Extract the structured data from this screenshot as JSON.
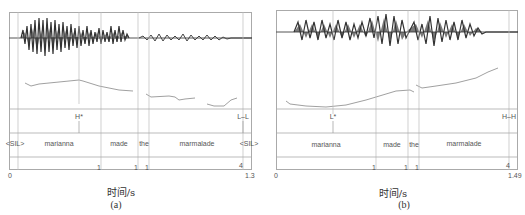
{
  "figure": {
    "panels": [
      {
        "id": "a",
        "caption": "(a)",
        "x_axis_label": "时间/s",
        "x_start": "0",
        "x_end": "1.3",
        "tone_tier": [
          {
            "label": "H*",
            "pos": 0.29
          },
          {
            "label": "L–L",
            "pos": 0.965
          }
        ],
        "word_tier": [
          {
            "label": "<SIL>",
            "start": 0.0,
            "end": 0.04
          },
          {
            "label": "marianna",
            "start": 0.04,
            "end": 0.38
          },
          {
            "label": "made",
            "start": 0.38,
            "end": 0.53
          },
          {
            "label": "the",
            "start": 0.53,
            "end": 0.575
          },
          {
            "label": "marmalade",
            "start": 0.575,
            "end": 0.965
          },
          {
            "label": "<SIL>",
            "start": 0.965,
            "end": 1.0
          }
        ],
        "break_tier": [
          {
            "label": "1",
            "pos": 0.38
          },
          {
            "label": "1",
            "pos": 0.53
          },
          {
            "label": "1",
            "pos": 0.575
          },
          {
            "label": "4",
            "pos": 0.965
          }
        ]
      },
      {
        "id": "b",
        "caption": "(b)",
        "x_axis_label": "时间/s",
        "x_start": "0",
        "x_end": "1.49",
        "tone_tier": [
          {
            "label": "L*",
            "pos": 0.235
          },
          {
            "label": "H–H",
            "pos": 0.965
          }
        ],
        "word_tier": [
          {
            "label": "marianna",
            "start": 0.0,
            "end": 0.415
          },
          {
            "label": "made",
            "start": 0.415,
            "end": 0.545
          },
          {
            "label": "the",
            "start": 0.545,
            "end": 0.59
          },
          {
            "label": "marmalade",
            "start": 0.59,
            "end": 0.965
          }
        ],
        "break_tier": [
          {
            "label": "1",
            "pos": 0.415
          },
          {
            "label": "1",
            "pos": 0.545
          },
          {
            "label": "1",
            "pos": 0.59
          },
          {
            "label": "4",
            "pos": 0.965
          }
        ]
      }
    ]
  }
}
